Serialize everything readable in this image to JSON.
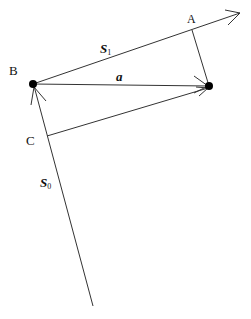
{
  "diagram": {
    "labels": {
      "A": "A",
      "B": "B",
      "C": "C",
      "S1_main": "S",
      "S1_sub": "1",
      "S0_main": "S",
      "S0_sub": "0",
      "a": "a"
    },
    "colors": {
      "line": "#333333",
      "point": "#000000",
      "background": "#ffffff"
    },
    "points": {
      "B": [
        33,
        84
      ],
      "P": [
        209,
        86
      ],
      "A": [
        192,
        30
      ],
      "C": [
        47,
        136
      ],
      "S1_tip": [
        240,
        13
      ],
      "S0_bottom": [
        93,
        306
      ]
    }
  }
}
